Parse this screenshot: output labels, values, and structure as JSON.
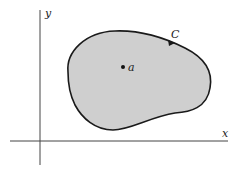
{
  "figure": {
    "type": "region-in-plane",
    "axes": {
      "x_label": "x",
      "y_label": "y"
    },
    "region": {
      "fill": "#cfcfcf",
      "stroke": "#1a1a1a"
    },
    "curve": {
      "label": "C",
      "orientation": "counterclockwise arrow marker on boundary"
    },
    "point": {
      "label": "a"
    }
  }
}
